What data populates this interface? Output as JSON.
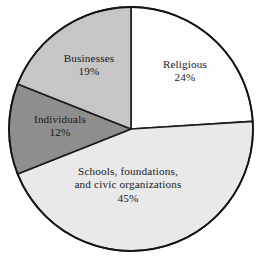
{
  "chart_data": {
    "type": "pie",
    "title": "",
    "subtitle": "",
    "xlabel": "",
    "ylabel": "",
    "grid": false,
    "legend": "none",
    "labels_inside_slices": true,
    "start_angle_deg": 0,
    "direction": "clockwise",
    "categories": [
      "Religious",
      "Schools, foundations, and civic organizations",
      "Individuals",
      "Businesses"
    ],
    "values": [
      24,
      45,
      12,
      19
    ],
    "units": "percent",
    "total": 100,
    "slices": [
      {
        "name": "Religious",
        "label_line1": "Religious",
        "label_line2": "",
        "value": 24,
        "value_label": "24%",
        "color": "#fdfdfd",
        "start_deg": 0,
        "end_deg": 86.4
      },
      {
        "name": "Schools, foundations, and civic organizations",
        "label_line1": "Schools, foundations,",
        "label_line2": "and civic organizations",
        "value": 45,
        "value_label": "45%",
        "color": "#e9e9e9",
        "start_deg": 86.4,
        "end_deg": 248.4
      },
      {
        "name": "Individuals",
        "label_line1": "Individuals",
        "label_line2": "",
        "value": 12,
        "value_label": "12%",
        "color": "#8e8e8e",
        "start_deg": 248.4,
        "end_deg": 291.6
      },
      {
        "name": "Businesses",
        "label_line1": "Businesses",
        "label_line2": "",
        "value": 19,
        "value_label": "19%",
        "color": "#c6c6c6",
        "start_deg": 291.6,
        "end_deg": 360
      }
    ],
    "geometry": {
      "center_x": 131,
      "center_y": 129,
      "radius": 122
    },
    "colors": {
      "background": "#ffffff",
      "outline": "#141414",
      "text": "#1a1a1a"
    }
  }
}
